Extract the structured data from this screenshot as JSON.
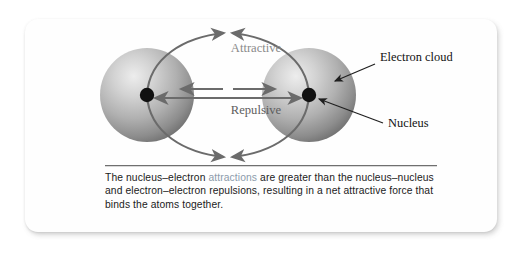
{
  "figure": {
    "type": "science-diagram",
    "labels": {
      "attractive": "Attractive",
      "repulsive": "Repulsive",
      "electron_cloud": "Electron cloud",
      "nucleus": "Nucleus"
    },
    "atoms": [
      {
        "id": "left-atom",
        "part_labels": [
          "electron cloud",
          "nucleus"
        ]
      },
      {
        "id": "right-atom",
        "part_labels": [
          "electron cloud",
          "nucleus"
        ]
      }
    ],
    "forces": [
      {
        "name": "Attractive",
        "description": "nucleus-electron",
        "arrow_style": "curved",
        "direction": "inward"
      },
      {
        "name": "Repulsive",
        "description": "nucleus-nucleus and electron-electron",
        "arrow_style": "straight",
        "direction": "outward"
      }
    ],
    "colors": {
      "arrow_gray": "#6b6b6b",
      "label_gray": "#8a8a8a",
      "label_dark": "#1a1a1a",
      "sphere_light": "#e7e7e7",
      "sphere_mid": "#b4b4b4",
      "sphere_dark": "#6e6e6e",
      "nucleus": "#111111",
      "caption_highlight": "#8c9bab",
      "rule": "#6f6f6f"
    }
  },
  "caption": {
    "part1": "The nucleus–electron ",
    "highlight": "attractions",
    "part2": " are greater than the nucleus–nucleus and electron–electron repulsions, resulting in a net attractive force that binds the atoms together.",
    "full_text": "The nucleus–electron attractions are greater than the nucleus–nucleus and electron–electron repulsions, resulting in a net attractive force that binds the atoms together."
  }
}
